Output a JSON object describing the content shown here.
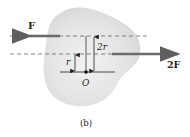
{
  "figure": {
    "caption": "(b)",
    "body_color": "#e2e2e2",
    "line_color": "#333333",
    "arrow_color": "#6b6b6b"
  },
  "forces": [
    {
      "label": "F",
      "direction": "left",
      "line": "upper"
    },
    {
      "label": "2F",
      "direction": "right",
      "line": "lower"
    }
  ],
  "dimensions": [
    {
      "label": "2r",
      "from": "O",
      "to": "upper-line"
    },
    {
      "label": "r",
      "from": "O",
      "to": "lower-line"
    }
  ],
  "point": {
    "label": "O"
  }
}
